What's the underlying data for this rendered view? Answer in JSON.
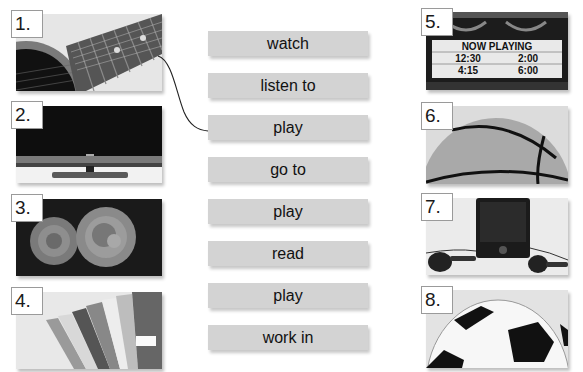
{
  "exercise": {
    "pictures": [
      {
        "number": "1.",
        "subject": "guitar"
      },
      {
        "number": "2.",
        "subject": "television"
      },
      {
        "number": "3.",
        "subject": "roses"
      },
      {
        "number": "4.",
        "subject": "magazines"
      },
      {
        "number": "5.",
        "subject": "movie-marquee",
        "sign_title": "NOW PLAYING",
        "times": [
          "12:30",
          "2:00",
          "4:15",
          "6:00"
        ]
      },
      {
        "number": "6.",
        "subject": "basketball"
      },
      {
        "number": "7.",
        "subject": "music-player"
      },
      {
        "number": "8.",
        "subject": "soccer-ball"
      }
    ],
    "verbs": [
      "watch",
      "listen to",
      "play",
      "go to",
      "play",
      "read",
      "play",
      "work in"
    ],
    "example_match": {
      "from_picture": "1.",
      "to_verb": "play"
    }
  },
  "colors": {
    "label_bg": "#d3d3d3",
    "number_border": "#9a9a9a",
    "connector": "#222222"
  }
}
